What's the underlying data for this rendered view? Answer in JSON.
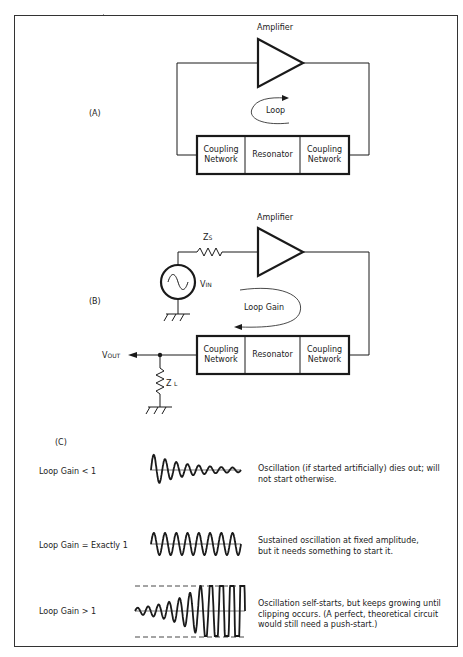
{
  "panel_a": {
    "label": "(A)",
    "amplifier_label": "Amplifier",
    "loop_label": "Loop",
    "blocks": [
      "Coupling Network",
      "Resonator",
      "Coupling Network"
    ]
  },
  "panel_b": {
    "label": "(B)",
    "amplifier_label": "Amplifier",
    "loop_label": "Loop Gain",
    "source_impedance": {
      "main": "Z",
      "sub": "S"
    },
    "input_voltage": {
      "main": "V",
      "sub": "IN"
    },
    "output_voltage": {
      "main": "V",
      "sub": "OUT"
    },
    "load_impedance": {
      "main": "Z",
      "sub": "L"
    },
    "blocks": [
      "Coupling Network",
      "Resonator",
      "Coupling Network"
    ]
  },
  "panel_c": {
    "label": "(C)",
    "rows": [
      {
        "condition": "Loop Gain < 1",
        "waveform": "decaying",
        "description": "Oscillation (if started artificially) dies out; will not start otherwise."
      },
      {
        "condition": "Loop Gain = Exactly 1",
        "waveform": "sustained",
        "description": "Sustained oscillation at fixed amplitude, but it needs something to start it."
      },
      {
        "condition": "Loop Gain > 1",
        "waveform": "growing-clipped",
        "description": "Oscillation self-starts, but keeps growing until clipping occurs. (A perfect, theoretical circuit would still need a push-start.)"
      }
    ]
  },
  "colors": {
    "line": "#1a1a1a",
    "background": "#ffffff"
  }
}
